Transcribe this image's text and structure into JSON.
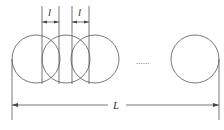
{
  "diagram": {
    "spacing_label_1": "l",
    "spacing_label_2": "l",
    "total_length_label": "L",
    "ellipsis": "......",
    "circles": [
      {
        "cx": 36,
        "cy": 59,
        "r": 24
      },
      {
        "cx": 66,
        "cy": 59,
        "r": 24
      },
      {
        "cx": 95,
        "cy": 59,
        "r": 24
      },
      {
        "cx": 195,
        "cy": 59,
        "r": 24
      }
    ],
    "stroke_color": "#555555"
  }
}
